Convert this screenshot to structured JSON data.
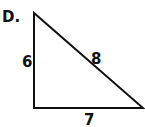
{
  "problem": {
    "label": "D.",
    "shape": "right-triangle",
    "sides": {
      "left": "6",
      "hypotenuse": "8",
      "bottom": "7"
    },
    "stroke_color": "#111111"
  }
}
